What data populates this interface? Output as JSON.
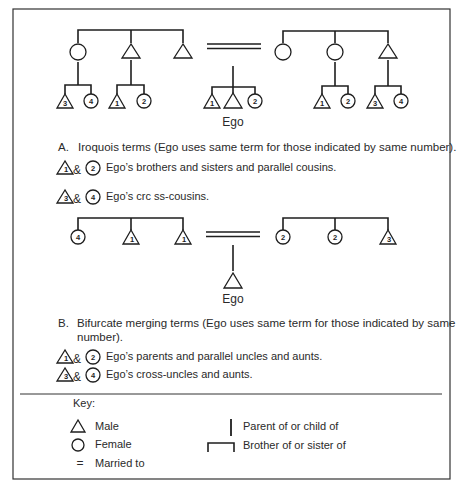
{
  "diagram_a": {
    "left_family": {
      "parents": [
        {
          "sex": "female",
          "num": ""
        },
        {
          "sex": "male",
          "num": ""
        },
        {
          "sex": "male",
          "num": ""
        }
      ],
      "children_of_female": [
        {
          "sex": "male",
          "num": "3"
        },
        {
          "sex": "female",
          "num": "4"
        }
      ],
      "children_of_male": [
        {
          "sex": "male",
          "num": "1"
        },
        {
          "sex": "female",
          "num": "2"
        }
      ]
    },
    "ego_children": [
      {
        "sex": "male",
        "num": "1"
      },
      {
        "sex": "male",
        "num": ""
      },
      {
        "sex": "female",
        "num": "2"
      }
    ],
    "ego_label": "Ego",
    "right_family": {
      "parents": [
        {
          "sex": "female",
          "num": ""
        },
        {
          "sex": "female",
          "num": ""
        },
        {
          "sex": "male",
          "num": ""
        }
      ],
      "children_of_female": [
        {
          "sex": "male",
          "num": "1"
        },
        {
          "sex": "female",
          "num": "2"
        }
      ],
      "children_of_male": [
        {
          "sex": "male",
          "num": "3"
        },
        {
          "sex": "female",
          "num": "4"
        }
      ]
    },
    "heading_letter": "A.",
    "heading_text": "Iroquois terms (Ego uses same term for those indicated by same number).",
    "legend": [
      {
        "tri": "1",
        "circ": "2",
        "amp": "&",
        "text": "Ego’s brothers and sisters and parallel cousins."
      },
      {
        "tri": "3",
        "circ": "4",
        "amp": "&",
        "text": "Ego’s crc ss-cousins."
      }
    ]
  },
  "diagram_b": {
    "left_siblings": [
      {
        "sex": "female",
        "num": "4"
      },
      {
        "sex": "male",
        "num": "1"
      },
      {
        "sex": "male",
        "num": "1"
      }
    ],
    "right_siblings": [
      {
        "sex": "female",
        "num": "2"
      },
      {
        "sex": "female",
        "num": "2"
      },
      {
        "sex": "male",
        "num": "3"
      }
    ],
    "ego_label": "Ego",
    "heading_letter": "B.",
    "heading_line1": "Bifurcate merging terms (Ego uses same term for those indicated by same",
    "heading_line2": "number).",
    "legend": [
      {
        "tri": "1",
        "circ": "2",
        "amp": "&",
        "text": "Ego’s parents and parallel uncles and aunts."
      },
      {
        "tri": "3",
        "circ": "4",
        "amp": "&",
        "text": "Ego’s cross-uncles and aunts."
      }
    ]
  },
  "key": {
    "title": "Key:",
    "male": "Male",
    "female": "Female",
    "married": "Married to",
    "married_symbol": "=",
    "parent": "Parent of or child of",
    "sibling": "Brother of or sister of"
  }
}
